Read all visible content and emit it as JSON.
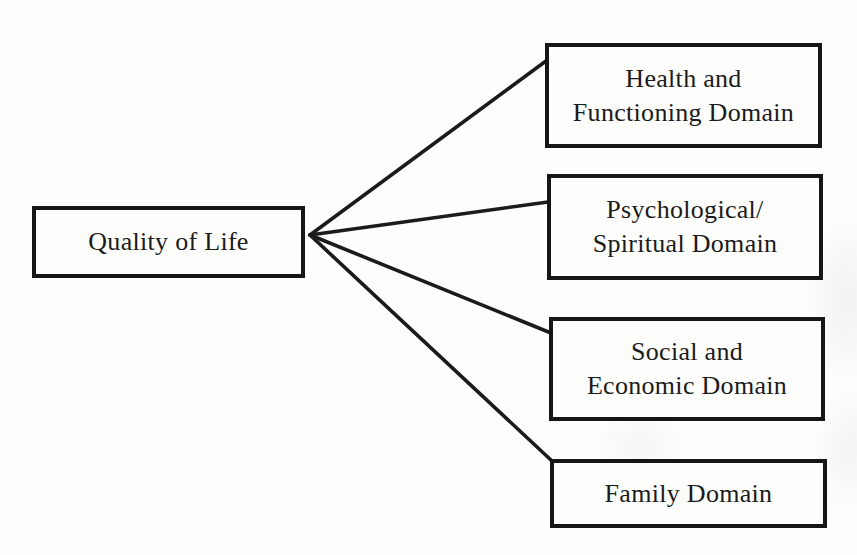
{
  "diagram": {
    "root": {
      "label": "Quality of Life"
    },
    "domains": [
      {
        "label": "Health and\nFunctioning Domain"
      },
      {
        "label": "Psychological/\nSpiritual Domain"
      },
      {
        "label": "Social and\nEconomic Domain"
      },
      {
        "label": "Family Domain"
      }
    ]
  },
  "colors": {
    "ink": "#1b1b1b",
    "paper": "#fdfdfb"
  }
}
